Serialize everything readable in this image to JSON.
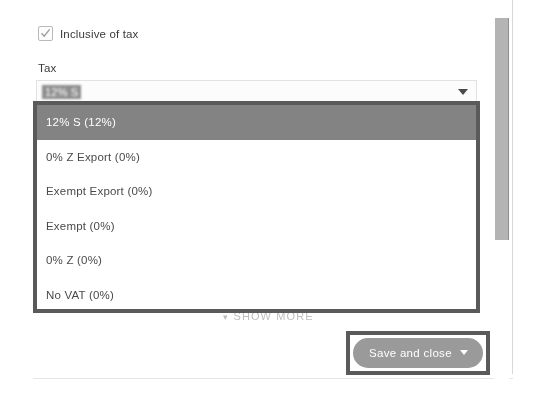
{
  "form": {
    "inclusive_checkbox": {
      "label": "Inclusive of tax",
      "checked": true,
      "icon": "check-icon"
    },
    "tax_field": {
      "label": "Tax",
      "value": "12% S",
      "caret_icon": "chevron-down-icon"
    }
  },
  "dropdown": {
    "options": [
      {
        "label": "12% S (12%)",
        "selected": true
      },
      {
        "label": "0% Z Export (0%)",
        "selected": false
      },
      {
        "label": "Exempt Export (0%)",
        "selected": false
      },
      {
        "label": "Exempt (0%)",
        "selected": false
      },
      {
        "label": "0% Z (0%)",
        "selected": false
      },
      {
        "label": "No VAT (0%)",
        "selected": false
      }
    ]
  },
  "show_more": {
    "label": "SHOW MORE",
    "icon": "chevron-down-icon",
    "chevron": "▾"
  },
  "footer": {
    "save_button": {
      "label": "Save and close",
      "caret_icon": "chevron-down-icon"
    }
  },
  "scrollbar": {
    "orientation": "vertical"
  },
  "colors": {
    "highlight_gray": "#838383",
    "annotation_border": "#5a5a5a",
    "button_gray": "#9a9a9a",
    "text_gray": "#4a4a4a"
  }
}
